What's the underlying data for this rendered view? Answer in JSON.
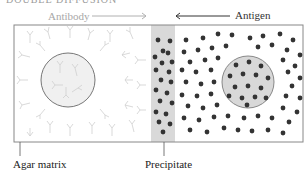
{
  "title": {
    "text": "DOUBLE DIFFUSION",
    "note": "clipped at top edge"
  },
  "labels": {
    "antibody": "Antibody",
    "antigen": "Antigen",
    "agar_matrix": "Agar matrix",
    "precipitate": "Precipitate"
  },
  "arrows": {
    "antibody_direction": "right",
    "antigen_direction": "left"
  },
  "colors": {
    "border": "#888888",
    "antibody": "#c8c8c8",
    "antigen_dot": "#333333",
    "well_fill": "#e6e6e6",
    "precipitate_band": "#d9d9d9"
  },
  "regions": {
    "left_well": "antibody well",
    "right_well": "antigen well",
    "band": "precipitate band"
  }
}
